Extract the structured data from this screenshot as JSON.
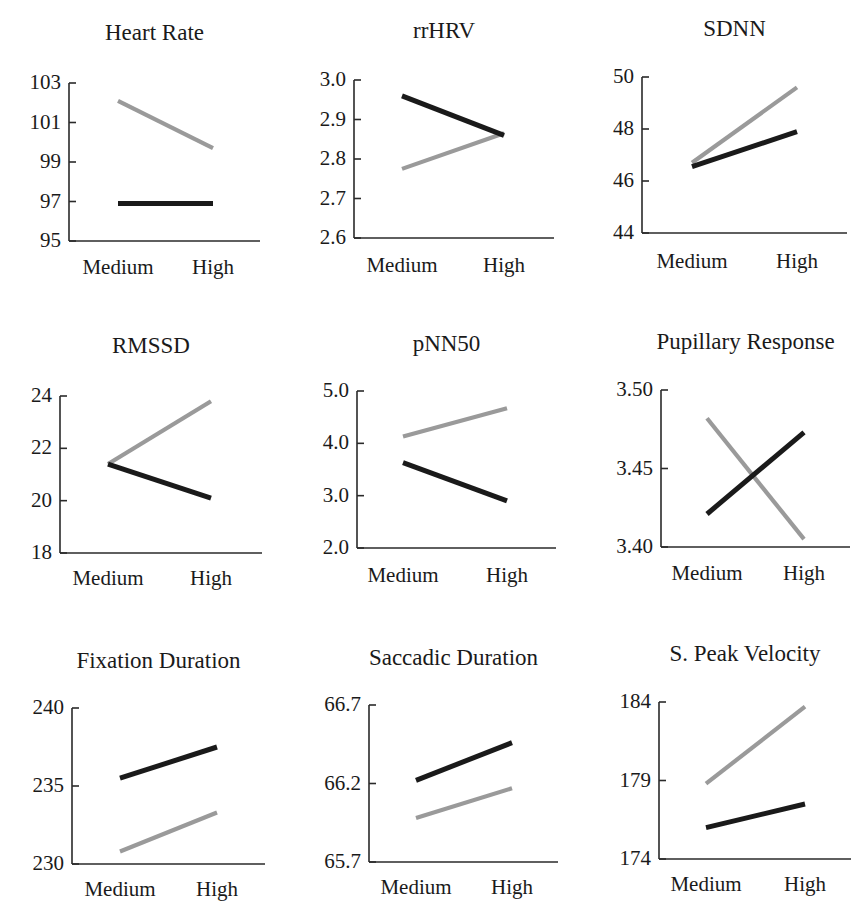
{
  "figure": {
    "categories": [
      "Medium",
      "High"
    ],
    "colors": {
      "black_series": "#1a1a1a",
      "gray_series": "#9a9a9a",
      "axis": "#2a2a2a"
    }
  },
  "chart_data": [
    {
      "type": "line",
      "title": "Heart Rate",
      "categories": [
        "Medium",
        "High"
      ],
      "yticks": [
        "103",
        "101",
        "99",
        "97",
        "95"
      ],
      "ylim": [
        95,
        103
      ],
      "series": [
        {
          "name": "gray",
          "color": "#9a9a9a",
          "values": [
            102.1,
            99.7
          ]
        },
        {
          "name": "black",
          "color": "#1a1a1a",
          "values": [
            96.9,
            96.9
          ]
        }
      ],
      "xlabel": "",
      "ylabel": "",
      "grid": false,
      "legend": "none"
    },
    {
      "type": "line",
      "title": "rrHRV",
      "categories": [
        "Medium",
        "High"
      ],
      "yticks": [
        "3.0",
        "2.9",
        "2.8",
        "2.7",
        "2.6"
      ],
      "ylim": [
        2.6,
        3.0
      ],
      "series": [
        {
          "name": "gray",
          "color": "#9a9a9a",
          "values": [
            2.775,
            2.865
          ]
        },
        {
          "name": "black",
          "color": "#1a1a1a",
          "values": [
            2.96,
            2.86
          ]
        }
      ],
      "xlabel": "",
      "ylabel": "",
      "grid": false,
      "legend": "none"
    },
    {
      "type": "line",
      "title": "SDNN",
      "categories": [
        "Medium",
        "High"
      ],
      "yticks": [
        "50",
        "48",
        "46",
        "44"
      ],
      "ylim": [
        44,
        50
      ],
      "series": [
        {
          "name": "gray",
          "color": "#9a9a9a",
          "values": [
            46.7,
            49.6
          ]
        },
        {
          "name": "black",
          "color": "#1a1a1a",
          "values": [
            46.55,
            47.9
          ]
        }
      ],
      "xlabel": "",
      "ylabel": "",
      "grid": false,
      "legend": "none"
    },
    {
      "type": "line",
      "title": "RMSSD",
      "categories": [
        "Medium",
        "High"
      ],
      "yticks": [
        "24",
        "22",
        "20",
        "18"
      ],
      "ylim": [
        18,
        24
      ],
      "series": [
        {
          "name": "gray",
          "color": "#9a9a9a",
          "values": [
            21.4,
            23.8
          ]
        },
        {
          "name": "black",
          "color": "#1a1a1a",
          "values": [
            21.4,
            20.1
          ]
        }
      ],
      "xlabel": "",
      "ylabel": "",
      "grid": false,
      "legend": "none"
    },
    {
      "type": "line",
      "title": "pNN50",
      "categories": [
        "Medium",
        "High"
      ],
      "yticks": [
        "5.0",
        "4.0",
        "3.0",
        "2.0"
      ],
      "ylim": [
        2.0,
        5.0
      ],
      "series": [
        {
          "name": "gray",
          "color": "#9a9a9a",
          "values": [
            4.13,
            4.67
          ]
        },
        {
          "name": "black",
          "color": "#1a1a1a",
          "values": [
            3.63,
            2.9
          ]
        }
      ],
      "xlabel": "",
      "ylabel": "",
      "grid": false,
      "legend": "none"
    },
    {
      "type": "line",
      "title": "Pupillary Response",
      "categories": [
        "Medium",
        "High"
      ],
      "yticks": [
        "3.50",
        "3.45",
        "3.40"
      ],
      "ylim": [
        3.4,
        3.5
      ],
      "series": [
        {
          "name": "gray",
          "color": "#9a9a9a",
          "values": [
            3.482,
            3.405
          ]
        },
        {
          "name": "black",
          "color": "#1a1a1a",
          "values": [
            3.421,
            3.473
          ]
        }
      ],
      "xlabel": "",
      "ylabel": "",
      "grid": false,
      "legend": "none"
    },
    {
      "type": "line",
      "title": "Fixation Duration",
      "categories": [
        "Medium",
        "High"
      ],
      "yticks": [
        "240",
        "235",
        "230"
      ],
      "ylim": [
        230,
        240
      ],
      "series": [
        {
          "name": "gray",
          "color": "#9a9a9a",
          "values": [
            230.8,
            233.3
          ]
        },
        {
          "name": "black",
          "color": "#1a1a1a",
          "values": [
            235.5,
            237.5
          ]
        }
      ],
      "xlabel": "",
      "ylabel": "",
      "grid": false,
      "legend": "none"
    },
    {
      "type": "line",
      "title": "Saccadic Duration",
      "categories": [
        "Medium",
        "High"
      ],
      "yticks": [
        "66.7",
        "66.2",
        "65.7"
      ],
      "ylim": [
        65.7,
        66.7
      ],
      "series": [
        {
          "name": "gray",
          "color": "#9a9a9a",
          "values": [
            65.98,
            66.17
          ]
        },
        {
          "name": "black",
          "color": "#1a1a1a",
          "values": [
            66.22,
            66.46
          ]
        }
      ],
      "xlabel": "",
      "ylabel": "",
      "grid": false,
      "legend": "none"
    },
    {
      "type": "line",
      "title": "S. Peak Velocity",
      "categories": [
        "Medium",
        "High"
      ],
      "yticks": [
        "184",
        "179",
        "174"
      ],
      "ylim": [
        174,
        184
      ],
      "series": [
        {
          "name": "gray",
          "color": "#9a9a9a",
          "values": [
            178.8,
            183.7
          ]
        },
        {
          "name": "black",
          "color": "#1a1a1a",
          "values": [
            176.0,
            177.5
          ]
        }
      ],
      "xlabel": "",
      "ylabel": "",
      "grid": false,
      "legend": "none"
    }
  ],
  "layout": [
    {
      "left": 0,
      "top": 0,
      "title_y": 20,
      "axis_x": 69,
      "plot_top": 83,
      "plot_bottom": 241,
      "axis_right": 260,
      "x_med": 118,
      "x_high": 213,
      "xlab_y": 257
    },
    {
      "left": 0,
      "top": 0,
      "title_y": 18,
      "axis_x": 354,
      "plot_top": 80,
      "plot_bottom": 238,
      "axis_right": 554,
      "x_med": 402,
      "x_high": 504,
      "xlab_y": 255
    },
    {
      "left": 0,
      "top": 0,
      "title_y": 16,
      "axis_x": 642,
      "plot_top": 77,
      "plot_bottom": 233,
      "axis_right": 847,
      "x_med": 692,
      "x_high": 797,
      "xlab_y": 251
    },
    {
      "left": 0,
      "top": 0,
      "title_y": 333,
      "axis_x": 60,
      "plot_top": 396,
      "plot_bottom": 553,
      "axis_right": 262,
      "x_med": 108,
      "x_high": 211,
      "xlab_y": 568
    },
    {
      "left": 0,
      "top": 0,
      "title_y": 331,
      "axis_x": 357,
      "plot_top": 391,
      "plot_bottom": 548,
      "axis_right": 556,
      "x_med": 403,
      "x_high": 507,
      "xlab_y": 565
    },
    {
      "left": 0,
      "top": 0,
      "title_y": 329,
      "axis_x": 661,
      "plot_top": 390,
      "plot_bottom": 547,
      "axis_right": 850,
      "x_med": 707,
      "x_high": 804,
      "xlab_y": 563
    },
    {
      "left": 0,
      "top": 0,
      "title_y": 648,
      "axis_x": 72,
      "plot_top": 708,
      "plot_bottom": 864,
      "axis_right": 265,
      "x_med": 120,
      "x_high": 217,
      "xlab_y": 879
    },
    {
      "left": 0,
      "top": 0,
      "title_y": 645,
      "axis_x": 369,
      "plot_top": 705,
      "plot_bottom": 862,
      "axis_right": 558,
      "x_med": 416,
      "x_high": 512,
      "xlab_y": 877
    },
    {
      "left": 0,
      "top": 0,
      "title_y": 641,
      "axis_x": 659,
      "plot_top": 702,
      "plot_bottom": 859,
      "axis_right": 851,
      "x_med": 706,
      "x_high": 805,
      "xlab_y": 874
    }
  ]
}
